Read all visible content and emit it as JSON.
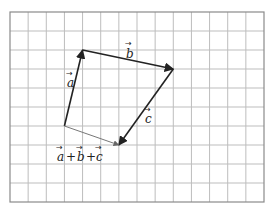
{
  "diagram": {
    "type": "vector-addition",
    "grid": {
      "columns": 14,
      "rows": 10,
      "left": 10,
      "top": 12,
      "right": 264,
      "bottom": 202,
      "line_color": "#bdbdbd",
      "border_color": "#8a8a8a"
    },
    "points": {
      "origin": {
        "col": 3,
        "row": 6
      },
      "after_a": {
        "col": 4,
        "row": 2
      },
      "after_b": {
        "col": 9,
        "row": 3
      },
      "after_c": {
        "col": 6,
        "row": 7
      }
    },
    "vectors": [
      {
        "id": "a",
        "label": "a",
        "from": "origin",
        "to": "after_a",
        "color": "#222222",
        "width": 1.6
      },
      {
        "id": "b",
        "label": "b",
        "from": "after_a",
        "to": "after_b",
        "color": "#222222",
        "width": 1.6
      },
      {
        "id": "c",
        "label": "c",
        "from": "after_b",
        "to": "after_c",
        "color": "#222222",
        "width": 1.6
      },
      {
        "id": "sum",
        "label": "a + b + c",
        "from": "origin",
        "to": "after_c",
        "color": "#777777",
        "width": 1.0
      }
    ],
    "labels": {
      "a": "a",
      "b": "b",
      "c": "c",
      "plus": "+",
      "arrow": "→"
    }
  }
}
